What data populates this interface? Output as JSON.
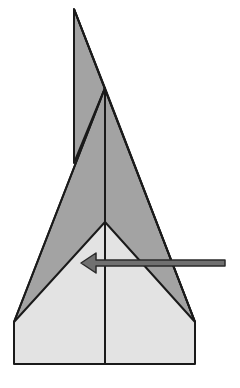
{
  "diagram": {
    "title": "Paper airplane folding step",
    "colors": {
      "background": "#ffffff",
      "folded_flap": "#a3a3a3",
      "paper_body": "#e3e3e3",
      "outline": "#1a1a1a",
      "arrow_fill": "#707070",
      "arrow_outline": "#2a2a2a"
    },
    "shapes": {
      "top_spike": "74,9 74,162 60,162 105,88 195,322",
      "outer_wing": "14,322 105,88 195,322",
      "inner_body": "14,322 105,222 195,322 195,364 14,364",
      "center_line": {
        "x": 105,
        "y1": 88,
        "y2": 364
      },
      "spike_line": {
        "x": 74,
        "y1": 9,
        "y2": 162
      }
    },
    "arrow": {
      "direction": "left",
      "label": "fold direction",
      "tip_x": 81,
      "tail_x": 225,
      "y": 263
    }
  }
}
